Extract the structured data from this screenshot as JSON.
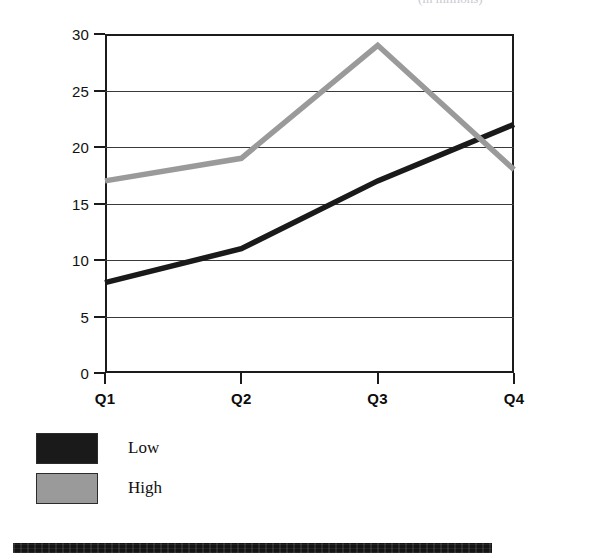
{
  "header": {
    "clipped_text": "(in millions)"
  },
  "chart_data": {
    "type": "line",
    "title": "",
    "subtitle": "",
    "xlabel": "",
    "ylabel": "",
    "categories": [
      "Q1",
      "Q2",
      "Q3",
      "Q4"
    ],
    "series": [
      {
        "name": "Low",
        "values": [
          8,
          11,
          17,
          22
        ],
        "color": "#1a1a1a"
      },
      {
        "name": "High",
        "values": [
          17,
          19,
          29,
          18
        ],
        "color": "#9a9a9a"
      }
    ],
    "ylim": [
      0,
      30
    ],
    "yticks": [
      0,
      5,
      10,
      15,
      20,
      25,
      30
    ],
    "ytick_labels": [
      "0",
      "5",
      "10",
      "15",
      "20",
      "25",
      "30"
    ],
    "grid": true,
    "grid_axis": "y",
    "legend_position": "below-left",
    "legend_entries": [
      {
        "label": "Low",
        "color": "#1a1a1a"
      },
      {
        "label": "High",
        "color": "#9a9a9a"
      }
    ]
  },
  "colors": {
    "low_series": "#1a1a1a",
    "high_series": "#9a9a9a",
    "axis": "#1b1b1b",
    "gridline": "#3a3a3a",
    "background": "#ffffff",
    "rule": "#141414"
  },
  "artifacts": {
    "bottom_rule_present": true
  }
}
